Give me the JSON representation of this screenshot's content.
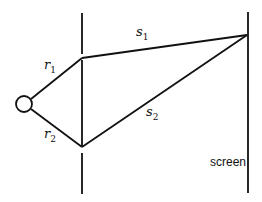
{
  "diagram": {
    "type": "double-slit geometry",
    "labels": {
      "r1": {
        "base": "r",
        "sub": "1"
      },
      "r2": {
        "base": "r",
        "sub": "2"
      },
      "s1": {
        "base": "s",
        "sub": "1"
      },
      "s2": {
        "base": "s",
        "sub": "2"
      },
      "screen": "screen"
    },
    "colors": {
      "stroke": "#111111",
      "background": "#ffffff"
    }
  }
}
